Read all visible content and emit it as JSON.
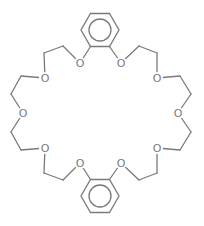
{
  "diagram": {
    "type": "chemical-structure",
    "compound_class": "dibenzo crown ether",
    "line_color": "#7a7a7a",
    "background": "#ffffff",
    "benzene_rings": [
      {
        "id": "top-benzene",
        "cx": 100,
        "cy": 30,
        "r": 19,
        "inner_r": 11
      },
      {
        "id": "bottom-benzene",
        "cx": 100,
        "cy": 196,
        "r": 19,
        "inner_r": 11
      }
    ],
    "atoms": [
      {
        "id": "O1",
        "label": "O",
        "x": 80,
        "y": 63
      },
      {
        "id": "O2",
        "label": "O",
        "x": 121,
        "y": 63
      },
      {
        "id": "O3",
        "label": "O",
        "x": 45,
        "y": 78
      },
      {
        "id": "O4",
        "label": "O",
        "x": 157,
        "y": 78
      },
      {
        "id": "O5",
        "label": "O",
        "x": 23,
        "y": 113
      },
      {
        "id": "O6",
        "label": "O",
        "x": 178,
        "y": 113
      },
      {
        "id": "O7",
        "label": "O",
        "x": 45,
        "y": 148
      },
      {
        "id": "O8",
        "label": "O",
        "x": 157,
        "y": 148
      },
      {
        "id": "O9",
        "label": "O",
        "x": 80,
        "y": 163
      },
      {
        "id": "O10",
        "label": "O",
        "x": 121,
        "y": 163
      }
    ],
    "bonds": [
      [
        90.5,
        46.5,
        80,
        63
      ],
      [
        80,
        63,
        63,
        46
      ],
      [
        63,
        46,
        44,
        53
      ],
      [
        44,
        53,
        45,
        78
      ],
      [
        45,
        78,
        21,
        76
      ],
      [
        21,
        76,
        11,
        94
      ],
      [
        11,
        94,
        23,
        113
      ],
      [
        23,
        113,
        11,
        132
      ],
      [
        11,
        132,
        21,
        150
      ],
      [
        21,
        150,
        45,
        148
      ],
      [
        45,
        148,
        44,
        173
      ],
      [
        44,
        173,
        63,
        180
      ],
      [
        63,
        180,
        80,
        163
      ],
      [
        80,
        163,
        90.5,
        179.5
      ],
      [
        109.5,
        46.5,
        121,
        63
      ],
      [
        121,
        63,
        139,
        46
      ],
      [
        139,
        46,
        157,
        53
      ],
      [
        157,
        53,
        157,
        78
      ],
      [
        157,
        78,
        180,
        76
      ],
      [
        180,
        76,
        191,
        94
      ],
      [
        191,
        94,
        178,
        113
      ],
      [
        178,
        113,
        191,
        132
      ],
      [
        191,
        132,
        180,
        150
      ],
      [
        180,
        150,
        157,
        148
      ],
      [
        157,
        148,
        157,
        173
      ],
      [
        157,
        173,
        139,
        180
      ],
      [
        139,
        180,
        121,
        163
      ],
      [
        121,
        163,
        109.5,
        179.5
      ]
    ]
  }
}
